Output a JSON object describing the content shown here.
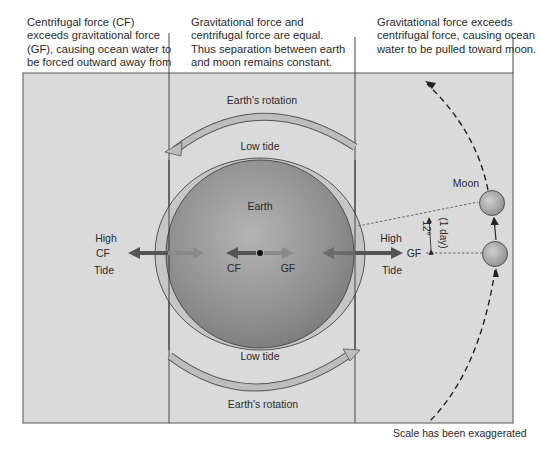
{
  "captions": {
    "left": "Centrifugal force (CF) exceeds gravitational force (GF), causing ocean water to be forced outward away from moon.",
    "middle": "Gravitational force and centrifugal force are equal. Thus separation between earth and moon remains constant.",
    "right": "Gravitational force exceeds centrifugal force, causing ocean water to be pulled toward moon."
  },
  "diagram": {
    "rotation_top": "Earth's rotation",
    "rotation_bottom": "Earth's rotation",
    "low_tide_top": "Low tide",
    "low_tide_bottom": "Low tide",
    "earth_label": "Earth",
    "left_bulge": {
      "high": "High",
      "force": "CF",
      "tide": "Tide"
    },
    "center_forces": {
      "left": "CF",
      "right": "GF"
    },
    "right_bulge": {
      "high": "High",
      "force": "GF",
      "tide": "Tide"
    },
    "moon_label": "Moon",
    "angle_label": "12°",
    "time_label": "(1 day)"
  },
  "footnote": "Scale has been exaggerated",
  "colors": {
    "panel": "#d9d9d9",
    "earth": "#8f8f8f",
    "water_bulge": "#c4c4c4",
    "arrow_dark": "#555555",
    "arrow_light": "#8a8a8a",
    "rotation_arrow": "#b8b8b8"
  }
}
